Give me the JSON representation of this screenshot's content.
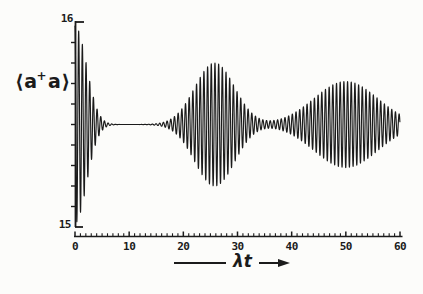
{
  "figure": {
    "background": "#fcfcfa",
    "ink": "#1b1b1b"
  },
  "labels": {
    "y_max": "16",
    "y_min": "15",
    "y_axis_title_pre": "⟨a",
    "y_axis_title_sup": "+",
    "y_axis_title_post": "a⟩",
    "x_axis_title": "λt"
  },
  "chart_data": {
    "type": "line",
    "title": "",
    "xlabel": "λt",
    "ylabel": "⟨a⁺a⟩",
    "xlim": [
      0,
      60
    ],
    "ylim": [
      15,
      16
    ],
    "x_major_ticks": [
      0,
      10,
      20,
      30,
      40,
      50,
      60
    ],
    "x_minor_tick_step": 1,
    "y_tick_step": 0.1,
    "grid": false,
    "legend": false,
    "signal": {
      "mean": 15.5,
      "oscillation_period": 0.68,
      "phase": "cos",
      "envelope_components": [
        {
          "name": "initial-collapse",
          "amplitude": 0.48,
          "center": 0,
          "width": 3.0
        },
        {
          "name": "first-revival",
          "amplitude": 0.3,
          "center": 25.8,
          "width": 5.2
        },
        {
          "name": "second-revival",
          "amplitude": 0.21,
          "center": 50,
          "width": 8.3
        }
      ],
      "envelope_samples": {
        "t": [
          0,
          2,
          4,
          6,
          10,
          15,
          18,
          21,
          24,
          26,
          28,
          31,
          34,
          37,
          40,
          44,
          47,
          50,
          53,
          56,
          60
        ],
        "amplitude": [
          0.48,
          0.31,
          0.08,
          0.01,
          0.0,
          0.0,
          0.03,
          0.13,
          0.27,
          0.3,
          0.25,
          0.11,
          0.03,
          0.02,
          0.05,
          0.13,
          0.18,
          0.21,
          0.18,
          0.13,
          0.05
        ]
      }
    }
  }
}
